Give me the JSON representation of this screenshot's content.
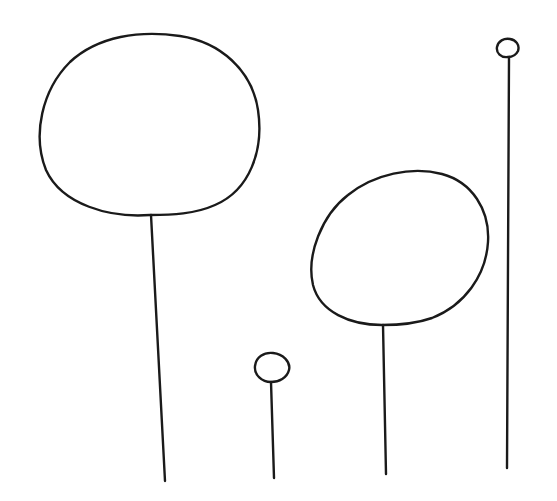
{
  "drawing": {
    "description": "Hand-drawn line art of four lollipop-like shapes (circles on stems)",
    "stroke_color": "#1a1a1a",
    "background": "#ffffff",
    "shapes": [
      {
        "name": "large-left"
      },
      {
        "name": "small-center"
      },
      {
        "name": "medium-right"
      },
      {
        "name": "tiny-far-right"
      }
    ]
  }
}
